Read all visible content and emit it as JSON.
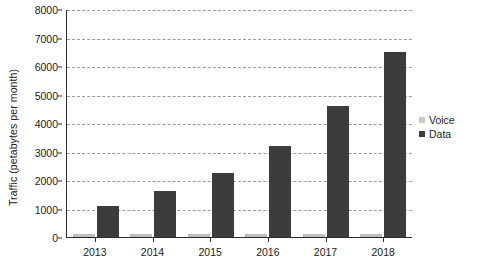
{
  "chart_data": {
    "type": "bar",
    "title": "",
    "subtitle": "",
    "xlabel": "",
    "ylabel": "Traffic (petabytes per month)",
    "categories": [
      "2013",
      "2014",
      "2015",
      "2016",
      "2017",
      "2018"
    ],
    "series": [
      {
        "name": "Voice",
        "color": "#c9c9c9",
        "values": [
          100,
          100,
          100,
          100,
          100,
          100
        ]
      },
      {
        "name": "Data",
        "color": "#3c3c3c",
        "values": [
          1100,
          1600,
          2250,
          3200,
          4600,
          6500
        ]
      }
    ],
    "ylim": [
      0,
      8000
    ],
    "yticks": [
      0,
      1000,
      2000,
      3000,
      4000,
      5000,
      6000,
      7000,
      8000
    ],
    "ytick_labels": [
      "0",
      "1000",
      "2000",
      "3000",
      "4000",
      "5000",
      "6000",
      "7000",
      "8000"
    ],
    "grid": true,
    "grid_style": "dashed",
    "grid_color": "#9a9a9a",
    "legend_position": "right",
    "legend": [
      {
        "label": "Voice",
        "color": "#c9c9c9"
      },
      {
        "label": "Data",
        "color": "#3c3c3c"
      }
    ],
    "axis_color": "#2b2b2b",
    "background": "#ffffff"
  }
}
